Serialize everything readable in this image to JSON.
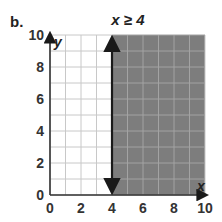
{
  "part_label": "b.",
  "chart_data": {
    "type": "inequality-graph",
    "title": "x ≥ 4",
    "inequality": {
      "variable": "x",
      "operator": "≥",
      "value": 4,
      "boundary": "solid",
      "shaded_side": "right"
    },
    "xlabel": "x",
    "ylabel": "y",
    "xlim": [
      0,
      10
    ],
    "ylim": [
      0,
      10
    ],
    "x_ticks": [
      0,
      2,
      4,
      6,
      8,
      10
    ],
    "y_ticks": [
      0,
      2,
      4,
      6,
      8,
      10
    ],
    "grid": true,
    "grid_step": 1,
    "shaded_region": {
      "x_from": 4,
      "x_to": 10,
      "y_from": 0,
      "y_to": 10
    }
  },
  "colors": {
    "shade": "#7d7d7d",
    "shade_grid": "#a3a3a3",
    "grid": "#c8c8c8",
    "axis": "#333333",
    "boundary": "#1a1a1a"
  }
}
